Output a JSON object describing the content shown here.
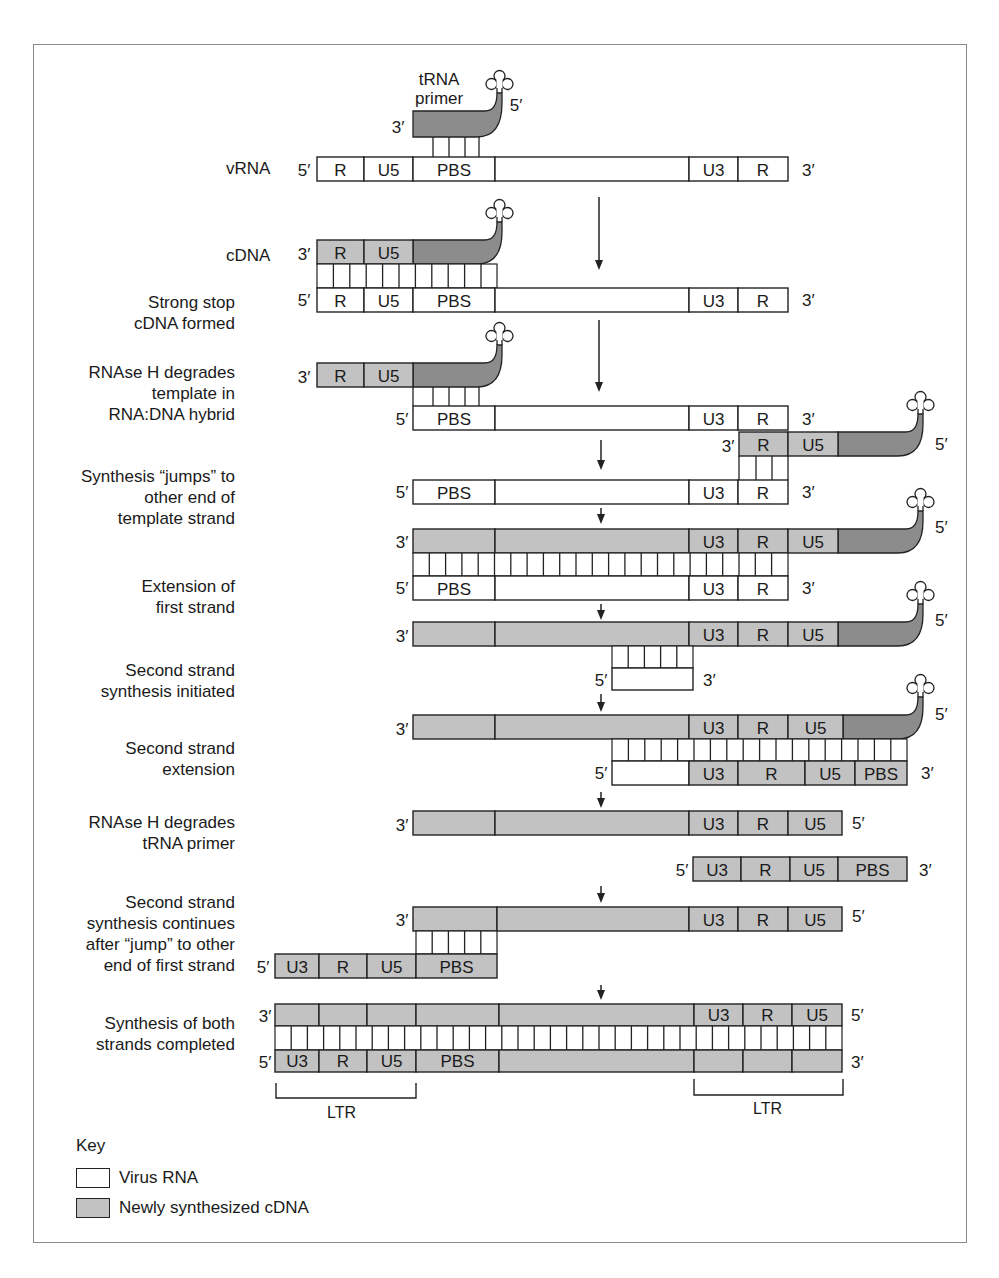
{
  "colors": {
    "rna": "#ffffff",
    "cdna": "#c2c2c2",
    "trna": "#8c8c8c",
    "stroke": "#222222",
    "frame": "#8a8a8a"
  },
  "labels": {
    "trna_primer": "tRNA\nprimer",
    "vrna": "vRNA",
    "cdna": "cDNA",
    "ltr": "LTR",
    "prime5": "5′",
    "prime3": "3′"
  },
  "steps": [
    {
      "id": "strong-stop",
      "text": "Strong stop\ncDNA formed"
    },
    {
      "id": "rnase-h-template",
      "text": "RNAse H degrades\ntemplate in\nRNA:DNA hybrid"
    },
    {
      "id": "jump",
      "text": "Synthesis “jumps” to\nother end of\ntemplate strand"
    },
    {
      "id": "extension-first",
      "text": "Extension of\nfirst strand"
    },
    {
      "id": "second-initiated",
      "text": "Second strand\nsynthesis initiated"
    },
    {
      "id": "second-extension",
      "text": "Second strand\nextension"
    },
    {
      "id": "rnase-h-trna",
      "text": "RNAse H degrades\ntRNA primer"
    },
    {
      "id": "second-continues",
      "text": "Second strand\nsynthesis continues\nafter “jump” to other\nend of first strand"
    },
    {
      "id": "both-completed",
      "text": "Synthesis of both\nstrands completed"
    }
  ],
  "segments": {
    "R": "R",
    "U5": "U5",
    "PBS": "PBS",
    "U3": "U3"
  },
  "key": {
    "title": "Key",
    "items": [
      {
        "label": "Virus RNA",
        "type": "rna"
      },
      {
        "label": "Newly synthesized cDNA",
        "type": "cdna"
      }
    ]
  },
  "chart_data": {
    "type": "diagram",
    "stages": [
      "tRNA primer binds PBS on vRNA (5′ R U5 PBS ... U3 R 3′)",
      "Strong stop cDNA formed (cDNA 3′ R U5 + tRNA)",
      "RNAse H degrades template in RNA:DNA hybrid",
      "Synthesis jumps to other end of template strand",
      "Extension of first strand",
      "Second strand synthesis initiated",
      "Second strand extension",
      "RNAse H degrades tRNA primer",
      "Second strand synthesis continues after jump to other end of first strand",
      "Synthesis of both strands completed (LTR: U3 R U5 at each end)"
    ]
  }
}
